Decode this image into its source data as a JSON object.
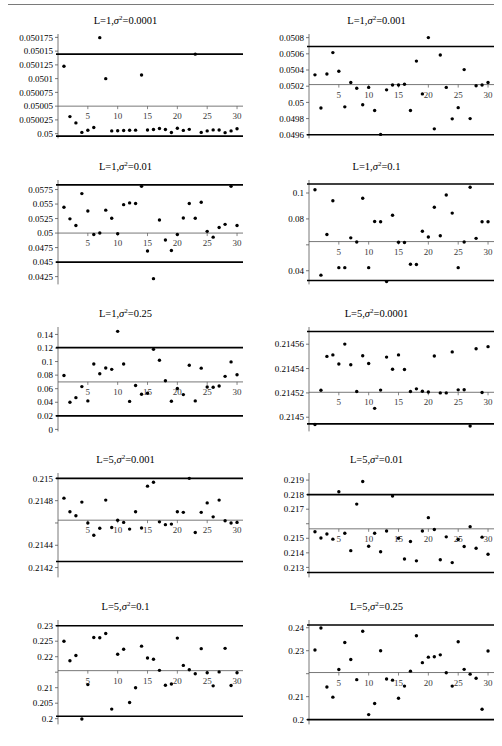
{
  "figure": {
    "layout": "5 rows x 2 columns of scatter control charts",
    "rule_top": true
  },
  "chart_data": [
    {
      "type": "scatter",
      "title": "L=1,σ²=0.0001",
      "title_parts": {
        "L": "L=1",
        "sigma": "σ",
        "exp": "2",
        "value": "=0.0001"
      },
      "xlabel": "",
      "ylabel": "",
      "xlim": [
        0,
        31
      ],
      "ylim": [
        0.049995,
        0.0501775
      ],
      "xticks": [
        5,
        10,
        15,
        20,
        25,
        30
      ],
      "xticklabels": [
        "5",
        "10",
        "15",
        "20",
        "25",
        "30"
      ],
      "yticks": [
        0.05,
        0.050025,
        0.05005,
        0.050075,
        0.0501,
        0.050125,
        0.05015,
        0.050175
      ],
      "yticklabels": [
        "0.05",
        "0.050025",
        "0.05005",
        "0.050075",
        "0.0501",
        "0.050125",
        "0.05015",
        "0.050175"
      ],
      "center_line": 0.05005,
      "upper_limit": 0.0501445,
      "lower_limit": 0.0499955,
      "x": [
        1,
        2,
        3,
        4,
        5,
        6,
        7,
        8,
        9,
        10,
        11,
        12,
        13,
        14,
        15,
        16,
        17,
        18,
        19,
        20,
        21,
        22,
        23,
        24,
        25,
        26,
        27,
        28,
        29,
        30
      ],
      "values": [
        0.0501225,
        0.050031,
        0.0500195,
        0.0500023,
        0.0500063,
        0.0500111,
        0.0501745,
        0.0501,
        0.050005,
        0.0500053,
        0.0500058,
        0.0500062,
        0.0500064,
        0.0501065,
        0.0500066,
        0.0500076,
        0.0500093,
        0.0500075,
        0.0500021,
        0.0500097,
        0.0500059,
        0.0500078,
        0.0501445,
        0.0500023,
        0.050005,
        0.0500068,
        0.0500065,
        0.0500018,
        0.050005,
        0.0500088
      ]
    },
    {
      "type": "scatter",
      "title": "L=1,σ²=0.001",
      "title_parts": {
        "L": "L=1",
        "sigma": "σ",
        "exp": "2",
        "value": "=0.001"
      },
      "xlabel": "",
      "ylabel": "",
      "xlim": [
        0,
        31
      ],
      "ylim": [
        0.04958,
        0.05082
      ],
      "xticks": [
        5,
        10,
        15,
        20,
        25,
        30
      ],
      "xticklabels": [
        "5",
        "10",
        "15",
        "20",
        "25",
        "30"
      ],
      "yticks": [
        0.0496,
        0.0498,
        0.05,
        0.0502,
        0.0504,
        0.0506,
        0.0508
      ],
      "yticklabels": [
        "0.0496",
        "0.0498",
        "0.05",
        "0.0502",
        "0.0504",
        "0.0506",
        "0.0508"
      ],
      "center_line": 0.05022,
      "upper_limit": 0.05069,
      "lower_limit": 0.0496,
      "x": [
        1,
        2,
        3,
        4,
        5,
        6,
        7,
        8,
        9,
        10,
        11,
        12,
        13,
        14,
        15,
        16,
        17,
        18,
        19,
        20,
        21,
        22,
        23,
        24,
        25,
        26,
        27,
        28,
        29,
        30
      ],
      "values": [
        0.05034,
        0.04993,
        0.05035,
        0.050615,
        0.050385,
        0.049945,
        0.050245,
        0.050175,
        0.04997,
        0.050185,
        0.0499,
        0.049605,
        0.050155,
        0.050215,
        0.050215,
        0.050225,
        0.0499,
        0.05051,
        0.050105,
        0.0508,
        0.049673,
        0.050585,
        0.050185,
        0.049797,
        0.049935,
        0.050405,
        0.0498,
        0.050205,
        0.050215,
        0.050245
      ]
    },
    {
      "type": "scatter",
      "title": "L=1,σ²=0.01",
      "title_parts": {
        "L": "L=1",
        "sigma": "σ",
        "exp": "2",
        "value": "=0.01"
      },
      "xlabel": "",
      "ylabel": "",
      "xlim": [
        0,
        31
      ],
      "ylim": [
        0.0415,
        0.0588
      ],
      "xticks": [
        5,
        10,
        15,
        20,
        25,
        30
      ],
      "xticklabels": [
        "5",
        "10",
        "15",
        "20",
        "25",
        "30"
      ],
      "yticks": [
        0.0425,
        0.045,
        0.0475,
        0.05,
        0.0525,
        0.055,
        0.0575
      ],
      "yticklabels": [
        "0.0425",
        "0.045",
        "0.0475",
        "0.05",
        "0.0525",
        "0.055",
        "0.0575"
      ],
      "center_line": 0.05,
      "upper_limit": 0.0583,
      "lower_limit": 0.045,
      "x": [
        1,
        2,
        3,
        4,
        5,
        6,
        7,
        8,
        9,
        10,
        11,
        12,
        13,
        14,
        15,
        16,
        17,
        18,
        19,
        20,
        21,
        22,
        23,
        24,
        25,
        26,
        27,
        28,
        29,
        30
      ],
      "values": [
        0.05445,
        0.05245,
        0.0513,
        0.0568,
        0.0538,
        0.04975,
        0.05,
        0.05395,
        0.05255,
        0.0499,
        0.0549,
        0.0552,
        0.0551,
        0.05805,
        0.04692,
        0.04215,
        0.05225,
        0.0488,
        0.047,
        0.04975,
        0.0526,
        0.0551,
        0.05255,
        0.0553,
        0.0503,
        0.0493,
        0.05095,
        0.0515,
        0.05805,
        0.0513
      ]
    },
    {
      "type": "scatter",
      "title": "L=1,σ²=0.1",
      "title_parts": {
        "L": "L=1",
        "sigma": "σ",
        "exp": "2",
        "value": "=0.1"
      },
      "xlabel": "",
      "ylabel": "",
      "xlim": [
        0,
        31
      ],
      "ylim": [
        0.031,
        0.1085
      ],
      "xticks": [
        5,
        10,
        15,
        20,
        25,
        30
      ],
      "xticklabels": [
        "5",
        "10",
        "15",
        "20",
        "25",
        "30"
      ],
      "yticks": [
        0.04,
        0.06,
        0.08,
        0.1
      ],
      "yticklabels": [
        "0.04",
        "",
        "0.08",
        "0.1"
      ],
      "center_line": 0.0625,
      "upper_limit": 0.107,
      "lower_limit": 0.0325,
      "x": [
        1,
        2,
        3,
        4,
        5,
        6,
        7,
        8,
        9,
        10,
        11,
        12,
        13,
        14,
        15,
        16,
        17,
        18,
        19,
        20,
        21,
        22,
        23,
        24,
        25,
        26,
        27,
        28,
        29,
        30
      ],
      "values": [
        0.1025,
        0.0366,
        0.068,
        0.094,
        0.0424,
        0.0424,
        0.0654,
        0.0622,
        0.096,
        0.0424,
        0.078,
        0.0778,
        0.0316,
        0.0828,
        0.062,
        0.0618,
        0.045,
        0.0448,
        0.0705,
        0.066,
        0.089,
        0.067,
        0.0985,
        0.0845,
        0.0424,
        0.0622,
        0.1045,
        0.065,
        0.0778,
        0.0778
      ]
    },
    {
      "type": "scatter",
      "title": "L=1,σ²=0.25",
      "title_parts": {
        "L": "L=1",
        "sigma": "σ",
        "exp": "2",
        "value": "=0.25"
      },
      "xlabel": "",
      "ylabel": "",
      "xlim": [
        0,
        31
      ],
      "ylim": [
        0,
        0.148
      ],
      "xticks": [
        5,
        10,
        15,
        20,
        25,
        30
      ],
      "xticklabels": [
        "5",
        "10",
        "15",
        "20",
        "25",
        "30"
      ],
      "yticks": [
        0,
        0.02,
        0.04,
        0.06,
        0.08,
        0.1,
        0.12,
        0.14
      ],
      "yticklabels": [
        "0",
        "0.02",
        "0.04",
        "0.06",
        "0.08",
        "0.1",
        "0.12",
        "0.14"
      ],
      "center_line": 0.07,
      "upper_limit": 0.1205,
      "lower_limit": 0.02,
      "x": [
        1,
        2,
        3,
        4,
        5,
        6,
        7,
        8,
        9,
        10,
        11,
        12,
        13,
        14,
        15,
        16,
        17,
        18,
        19,
        20,
        21,
        22,
        23,
        24,
        25,
        26,
        27,
        28,
        29,
        30
      ],
      "values": [
        0.0795,
        0.04,
        0.0468,
        0.0631,
        0.042,
        0.0965,
        0.082,
        0.0905,
        0.0885,
        0.1445,
        0.0965,
        0.0413,
        0.0647,
        0.0518,
        0.0533,
        0.118,
        0.102,
        0.0718,
        0.0415,
        0.0602,
        0.0513,
        0.0945,
        0.042,
        0.0903,
        0.0625,
        0.0622,
        0.064,
        0.0782,
        0.0995,
        0.0805
      ]
    },
    {
      "type": "scatter",
      "title": "L=5,σ²=0.0001",
      "title_parts": {
        "L": "L=5",
        "sigma": "σ",
        "exp": "2",
        "value": "=0.0001"
      },
      "xlabel": "",
      "ylabel": "",
      "xlim": [
        0,
        31
      ],
      "ylim": [
        0.21449,
        0.2145725
      ],
      "xticks": [
        5,
        10,
        15,
        20,
        25,
        30
      ],
      "xticklabels": [
        "5",
        "10",
        "15",
        "20",
        "25",
        "30"
      ],
      "yticks": [
        0.2145,
        0.21452,
        0.21454,
        0.21456
      ],
      "yticklabels": [
        "0.2145",
        "0.21452",
        "0.21454",
        "0.21456"
      ],
      "center_line": 0.2145205,
      "upper_limit": 0.2145705,
      "lower_limit": 0.2144945,
      "x": [
        1,
        2,
        3,
        4,
        5,
        6,
        7,
        8,
        9,
        10,
        11,
        12,
        13,
        14,
        15,
        16,
        17,
        18,
        19,
        20,
        21,
        22,
        23,
        24,
        25,
        26,
        27,
        28,
        29,
        30
      ],
      "values": [
        0.214494,
        0.2145222,
        0.21455,
        0.2145512,
        0.2145437,
        0.2145601,
        0.2145431,
        0.2145212,
        0.2145505,
        0.2145442,
        0.2145073,
        0.2145223,
        0.2145494,
        0.2145394,
        0.2145512,
        0.2145392,
        0.2145212,
        0.2145233,
        0.2145213,
        0.2145207,
        0.2145503,
        0.21452,
        0.21452,
        0.2145537,
        0.2145225,
        0.2145226,
        0.2144928,
        0.2145563,
        0.2145203,
        0.214558
      ]
    },
    {
      "type": "scatter",
      "title": "L=5,σ²=0.001",
      "title_parts": {
        "L": "L=5",
        "sigma": "σ",
        "exp": "2",
        "value": "=0.001"
      },
      "xlabel": "",
      "ylabel": "",
      "xlim": [
        0,
        31
      ],
      "ylim": [
        0.21413,
        0.21503
      ],
      "xticks": [
        5,
        10,
        15,
        20,
        25,
        30
      ],
      "xticklabels": [
        "5",
        "10",
        "15",
        "20",
        "25",
        "30"
      ],
      "yticks": [
        0.2142,
        0.2144,
        0.2146,
        0.2148,
        0.215
      ],
      "yticklabels": [
        "0.2142",
        "0.2144",
        "",
        "0.2148",
        "0.215"
      ],
      "center_line": 0.214625,
      "upper_limit": 0.215,
      "lower_limit": 0.214255,
      "x": [
        1,
        2,
        3,
        4,
        5,
        6,
        7,
        8,
        9,
        10,
        11,
        12,
        13,
        14,
        15,
        16,
        17,
        18,
        19,
        20,
        21,
        22,
        23,
        24,
        25,
        26,
        27,
        28,
        29,
        30
      ],
      "values": [
        0.2148225,
        0.2147,
        0.214665,
        0.214787,
        0.2146,
        0.21449,
        0.214552,
        0.214805,
        0.21456,
        0.214625,
        0.214605,
        0.214545,
        0.2147,
        0.214555,
        0.21493,
        0.214965,
        0.21461,
        0.214585,
        0.21459,
        0.2147,
        0.214695,
        0.215,
        0.214515,
        0.214695,
        0.21478,
        0.214655,
        0.214805,
        0.21462,
        0.2146,
        0.214605
      ]
    },
    {
      "type": "scatter",
      "title": "L=5,σ²=0.01",
      "title_parts": {
        "L": "L=5",
        "sigma": "σ",
        "exp": "2",
        "value": "=0.01"
      },
      "xlabel": "",
      "ylabel": "",
      "xlim": [
        0,
        31
      ],
      "ylim": [
        0.21245,
        0.21935
      ],
      "xticks": [
        5,
        10,
        15,
        20,
        25,
        30
      ],
      "xticklabels": [
        "5",
        "10",
        "15",
        "20",
        "25",
        "30"
      ],
      "yticks": [
        0.213,
        0.214,
        0.215,
        0.216,
        0.217,
        0.218,
        0.219
      ],
      "yticklabels": [
        "0.213",
        "0.214",
        "0.215",
        "",
        "0.217",
        "0.218",
        "0.219"
      ],
      "center_line": 0.21565,
      "upper_limit": 0.218,
      "lower_limit": 0.21265,
      "x": [
        1,
        2,
        3,
        4,
        5,
        6,
        7,
        8,
        9,
        10,
        11,
        12,
        13,
        14,
        15,
        16,
        17,
        18,
        19,
        20,
        21,
        22,
        23,
        24,
        25,
        26,
        27,
        28,
        29,
        30
      ],
      "values": [
        0.21545,
        0.21502,
        0.2153,
        0.21494,
        0.2182,
        0.21535,
        0.21415,
        0.21735,
        0.2189,
        0.21445,
        0.21535,
        0.21408,
        0.2155,
        0.2179,
        0.215,
        0.21358,
        0.21478,
        0.21345,
        0.2155,
        0.21642,
        0.2156,
        0.21353,
        0.2151,
        0.21333,
        0.21492,
        0.21444,
        0.2158,
        0.21432,
        0.21508,
        0.2139
      ]
    },
    {
      "type": "scatter",
      "title": "L=5,σ²=0.1",
      "title_parts": {
        "L": "L=5",
        "sigma": "σ",
        "exp": "2",
        "value": "=0.1"
      },
      "xlabel": "",
      "ylabel": "",
      "xlim": [
        0,
        31
      ],
      "ylim": [
        0.1988,
        0.2312
      ],
      "xticks": [
        5,
        10,
        15,
        20,
        25,
        30
      ],
      "xticklabels": [
        "5",
        "10",
        "15",
        "20",
        "25",
        "30"
      ],
      "yticks": [
        0.2,
        0.205,
        0.21,
        0.215,
        0.22,
        0.225,
        0.23
      ],
      "yticklabels": [
        "0.2",
        "0.205",
        "0.21",
        "",
        "0.22",
        "0.225",
        "0.23"
      ],
      "center_line": 0.2155,
      "upper_limit": 0.23,
      "lower_limit": 0.2008,
      "x": [
        1,
        2,
        3,
        4,
        5,
        6,
        7,
        8,
        9,
        10,
        11,
        12,
        13,
        14,
        15,
        16,
        17,
        18,
        19,
        20,
        21,
        22,
        23,
        24,
        25,
        26,
        27,
        28,
        29,
        30
      ],
      "values": [
        0.225,
        0.2187,
        0.2204,
        0.1999,
        0.211,
        0.2262,
        0.2261,
        0.2275,
        0.2031,
        0.2208,
        0.2224,
        0.2052,
        0.21,
        0.2234,
        0.2196,
        0.2192,
        0.2156,
        0.2108,
        0.2112,
        0.226,
        0.2172,
        0.2158,
        0.2145,
        0.2226,
        0.2148,
        0.2106,
        0.2151,
        0.2227,
        0.2107,
        0.2148
      ]
    },
    {
      "type": "scatter",
      "title": "L=5,σ²=0.25",
      "title_parts": {
        "L": "L=5",
        "sigma": "σ",
        "exp": "2",
        "value": "=0.25"
      },
      "xlabel": "",
      "ylabel": "",
      "xlim": [
        0,
        31
      ],
      "ylim": [
        0.1988,
        0.2425
      ],
      "xticks": [
        5,
        10,
        15,
        20,
        25,
        30
      ],
      "xticklabels": [
        "5",
        "10",
        "15",
        "20",
        "25",
        "30"
      ],
      "yticks": [
        0.2,
        0.21,
        0.22,
        0.23,
        0.24
      ],
      "yticklabels": [
        "0.2",
        "0.21",
        "",
        "0.23",
        "0.24"
      ],
      "center_line": 0.2205,
      "upper_limit": 0.2412,
      "lower_limit": 0.2,
      "x": [
        1,
        2,
        3,
        4,
        5,
        6,
        7,
        8,
        9,
        10,
        11,
        12,
        13,
        14,
        15,
        16,
        17,
        18,
        19,
        20,
        21,
        22,
        23,
        24,
        25,
        26,
        27,
        28,
        29,
        30
      ],
      "values": [
        0.2303,
        0.2399,
        0.2142,
        0.2098,
        0.2218,
        0.2336,
        0.2262,
        0.2174,
        0.2385,
        0.2022,
        0.207,
        0.23,
        0.2177,
        0.2172,
        0.2093,
        0.2146,
        0.2211,
        0.2365,
        0.2248,
        0.2272,
        0.2274,
        0.2282,
        0.2204,
        0.2146,
        0.2339,
        0.2219,
        0.2198,
        0.218,
        0.2045,
        0.2299
      ]
    }
  ]
}
